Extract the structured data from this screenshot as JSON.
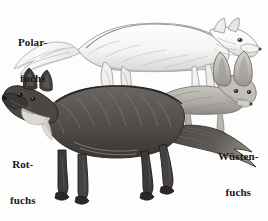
{
  "figure": {
    "kind": "engraving-plate",
    "background_color": "#fdfdfd",
    "text_color": "#171717",
    "width": 268,
    "height": 221
  },
  "labels": [
    {
      "id": "polarfuchs",
      "line1": "Polar-",
      "line2": "fuchs",
      "animal": "arctic-fox",
      "position": "top-left"
    },
    {
      "id": "rotfuchs",
      "line1": "Rot-",
      "line2": "fuchs",
      "animal": "red-fox",
      "position": "bottom-left"
    },
    {
      "id": "wuestenfuchs",
      "line1": "Wüsten-",
      "line2": "fuchs",
      "animal": "fennec-fox",
      "position": "bottom-right"
    }
  ],
  "animals": {
    "arctic_fox": {
      "name": "Polarfuchs",
      "tone": "#f2f2f0",
      "outline": "#8c8c8c",
      "shadow": "#bdbdbd",
      "facing": "right",
      "note": "large white bushy tail at left, standing, head at right"
    },
    "red_fox": {
      "name": "Rotfuchs",
      "tone": "#6a6561",
      "outline": "#2f2c2a",
      "shadow": "#3c3836",
      "facing": "left",
      "note": "dark shaggy coat, head at left, long brush tail at right"
    },
    "fennec_fox": {
      "name": "Wüstenfuchs",
      "tone": "#b5b2ac",
      "outline": "#6f6c68",
      "shadow": "#8f8c87",
      "facing": "right",
      "note": "small body, very large pointed ears, head at right"
    }
  }
}
